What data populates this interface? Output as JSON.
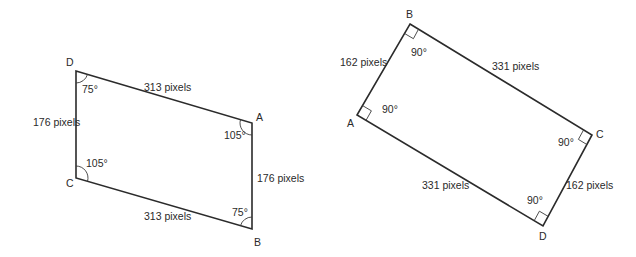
{
  "figures": [
    {
      "name": "parallelogram",
      "vertices": {
        "D": "D",
        "A": "A",
        "B": "B",
        "C": "C"
      },
      "sides": {
        "DA": "313 pixels",
        "CB": "313 pixels",
        "DC": "176 pixels",
        "AB": "176 pixels"
      },
      "angles": {
        "D": "75°",
        "A": "105°",
        "B": "75°",
        "C": "105°"
      }
    },
    {
      "name": "rectangle",
      "vertices": {
        "A": "A",
        "B": "B",
        "C": "C",
        "D": "D"
      },
      "sides": {
        "AB": "162 pixels",
        "BC": "331 pixels",
        "AD": "331 pixels",
        "CD": "162 pixels"
      },
      "angles": {
        "A": "90°",
        "B": "90°",
        "C": "90°",
        "D": "90°"
      }
    }
  ]
}
